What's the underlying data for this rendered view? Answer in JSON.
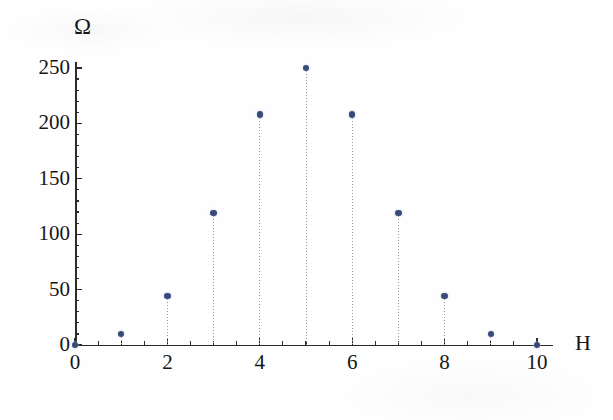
{
  "chart_data": {
    "type": "scatter",
    "subtype": "stem",
    "title": "",
    "xlabel": "H",
    "ylabel": "Ω",
    "x": [
      0,
      1,
      2,
      3,
      4,
      5,
      6,
      7,
      8,
      9,
      10
    ],
    "values": [
      0,
      10,
      44,
      119,
      208,
      250,
      208,
      119,
      44,
      10,
      0
    ],
    "xlim": [
      0,
      10
    ],
    "ylim": [
      0,
      258
    ],
    "x_tick_labels": [
      "0",
      "2",
      "4",
      "6",
      "8",
      "10"
    ],
    "x_tick_values": [
      0,
      2,
      4,
      6,
      8,
      10
    ],
    "x_minor_tick_values": [
      1,
      3,
      5,
      7,
      9
    ],
    "y_tick_labels": [
      "0",
      "50",
      "100",
      "150",
      "200",
      "250"
    ],
    "y_tick_values": [
      0,
      50,
      100,
      150,
      200,
      250
    ],
    "y_minor_step": 10,
    "grid": false,
    "legend": null,
    "marker_color": "#3a4a78",
    "stem_color": "#9a9aa8",
    "axis_color": "#2b2b2b",
    "background_color": "#fefefe"
  }
}
